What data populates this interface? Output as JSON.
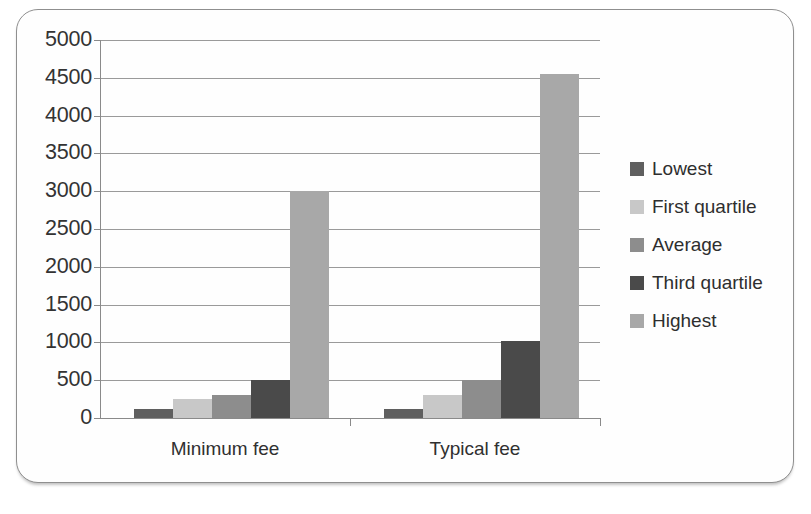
{
  "chart_data": {
    "type": "bar",
    "title": "",
    "subtitle": "",
    "xlabel": "",
    "ylabel": "",
    "categories": [
      "Minimum fee",
      "Typical fee"
    ],
    "series": [
      {
        "name": "Lowest",
        "color": "#5f5f5f",
        "values": [
          120,
          120
        ]
      },
      {
        "name": "First quartile",
        "color": "#c8c8c8",
        "values": [
          250,
          300
        ]
      },
      {
        "name": "Average",
        "color": "#8d8d8d",
        "values": [
          300,
          500
        ]
      },
      {
        "name": "Third quartile",
        "color": "#4a4a4a",
        "values": [
          500,
          1020
        ]
      },
      {
        "name": "Highest",
        "color": "#a8a8a8",
        "values": [
          3000,
          4550
        ]
      }
    ],
    "ylim": [
      0,
      5000
    ],
    "yticks": [
      0,
      500,
      1000,
      1500,
      2000,
      2500,
      3000,
      3500,
      4000,
      4500,
      5000
    ],
    "ytick_labels": [
      "0",
      "500",
      "1000",
      "1500",
      "2000",
      "2500",
      "3000",
      "3500",
      "4000",
      "4500",
      "5000"
    ],
    "grid": true,
    "legend_position": "right",
    "legend_entries": [
      "Lowest",
      "First quartile",
      "Average",
      "Third quartile",
      "Highest"
    ]
  }
}
